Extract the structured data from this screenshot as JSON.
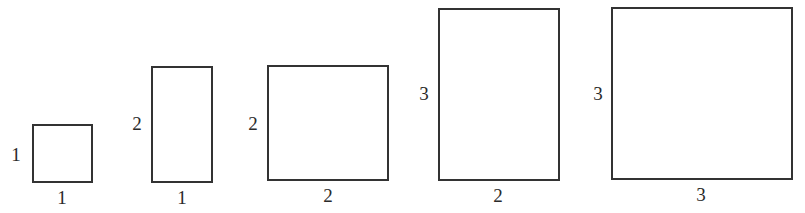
{
  "diagram": {
    "line_color": "#333333",
    "shapes": [
      {
        "id": "r1",
        "width_label": "1",
        "height_label": "1",
        "width": 1,
        "height": 1
      },
      {
        "id": "r2",
        "width_label": "1",
        "height_label": "2",
        "width": 1,
        "height": 2
      },
      {
        "id": "r3",
        "width_label": "2",
        "height_label": "2",
        "width": 2,
        "height": 2
      },
      {
        "id": "r4",
        "width_label": "2",
        "height_label": "3",
        "width": 2,
        "height": 3
      },
      {
        "id": "r5",
        "width_label": "3",
        "height_label": "3",
        "width": 3,
        "height": 3
      }
    ]
  }
}
